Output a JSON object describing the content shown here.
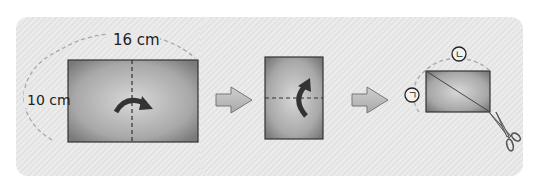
{
  "diagram": {
    "step1": {
      "width_label": "16 cm",
      "height_label": "10 cm",
      "fold": "vertical-dashed-line",
      "arrow": "curved-arrow-right"
    },
    "step2": {
      "fold": "horizontal-dashed-line",
      "arrow": "curved-arrow-up"
    },
    "step3": {
      "top_label": "ㄴ",
      "left_label": "ㄱ",
      "cut": "diagonal-line",
      "tool": "scissors-icon"
    },
    "arrows": [
      "arrow-right-icon",
      "arrow-right-icon"
    ],
    "colors": {
      "background": "#e8e8e8",
      "paper": "#9a9a9a",
      "outline": "#333333",
      "dashed": "#aaaaaa"
    }
  }
}
